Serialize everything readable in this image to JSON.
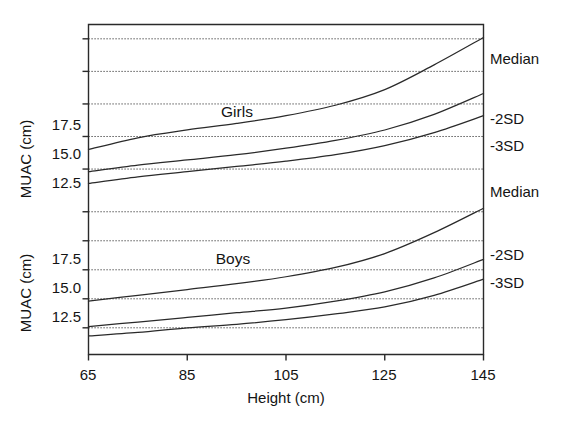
{
  "figure": {
    "background_color": "#ffffff",
    "line_color": "#2a2a2a",
    "text_color": "#141414"
  },
  "axes": {
    "x_axis_title": "Height (cm)",
    "y_axis_title_top": "MUAC (cm)",
    "y_axis_title_bottom": "MUAC (cm)",
    "x_ticks": [
      "65",
      "85",
      "105",
      "125",
      "145"
    ],
    "y_ticks_top": [
      "12.5",
      "15.0",
      "17.5"
    ],
    "y_ticks_bottom": [
      "12.5",
      "15.0",
      "17.5"
    ]
  },
  "panels": {
    "top_label": "Girls",
    "bottom_label": "Boys"
  },
  "curve_labels": {
    "girls_median": "Median",
    "girls_2sd": "-2SD",
    "girls_3sd": "-3SD",
    "boys_median": "Median",
    "boys_2sd": "-2SD",
    "boys_3sd": "-3SD"
  },
  "chart_data": {
    "type": "line",
    "title": "",
    "xlabel": "Height (cm)",
    "ylabel": "MUAC (cm)",
    "xlim": [
      63,
      147
    ],
    "xticks": [
      65,
      85,
      105,
      125,
      145
    ],
    "grid": true,
    "legend_position": "right-inline-labels",
    "panels": [
      {
        "name": "Girls",
        "ylim": [
          10.2,
          23.6
        ],
        "yticks_labeled": [
          12.5,
          15.0,
          17.5
        ],
        "gridlines": [
          12.5,
          15.0,
          17.5,
          20.0,
          22.5
        ],
        "x": [
          65,
          75,
          85,
          95,
          105,
          115,
          125,
          135,
          145
        ],
        "series": [
          {
            "name": "Median",
            "label": "Median",
            "values": [
              14.0,
              14.9,
              15.5,
              16.0,
              16.6,
              17.4,
              18.6,
              20.5,
              22.6
            ]
          },
          {
            "name": "-2SD",
            "label": "-2SD",
            "values": [
              12.3,
              12.8,
              13.2,
              13.6,
              14.1,
              14.7,
              15.5,
              16.7,
              18.3
            ]
          },
          {
            "name": "-3SD",
            "label": "-3SD",
            "values": [
              11.4,
              11.9,
              12.3,
              12.7,
              13.1,
              13.6,
              14.3,
              15.3,
              16.6
            ]
          }
        ]
      },
      {
        "name": "Boys",
        "ylim": [
          10.2,
          23.6
        ],
        "yticks_labeled": [
          12.5,
          15.0,
          17.5
        ],
        "gridlines": [
          12.5,
          15.0,
          17.5,
          20.0,
          22.5
        ],
        "x": [
          65,
          75,
          85,
          95,
          105,
          115,
          125,
          135,
          145
        ],
        "series": [
          {
            "name": "Median",
            "label": "Median",
            "values": [
              14.8,
              15.3,
              15.8,
              16.3,
              16.9,
              17.7,
              18.9,
              20.7,
              22.8
            ]
          },
          {
            "name": "-2SD",
            "label": "-2SD",
            "values": [
              12.6,
              13.0,
              13.4,
              13.8,
              14.2,
              14.8,
              15.6,
              16.8,
              18.4
            ]
          },
          {
            "name": "-3SD",
            "label": "-3SD",
            "values": [
              11.8,
              12.1,
              12.5,
              12.8,
              13.2,
              13.7,
              14.3,
              15.3,
              16.7
            ]
          }
        ]
      }
    ]
  }
}
